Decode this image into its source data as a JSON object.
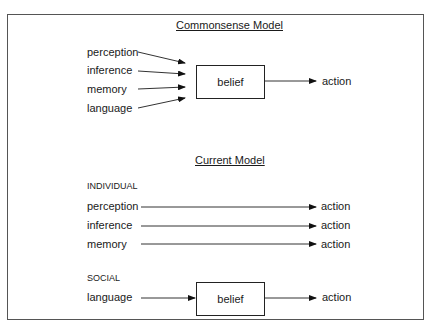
{
  "commonsense_model": {
    "title": "Commonsense Model",
    "inputs": [
      "perception",
      "inference",
      "memory",
      "language"
    ],
    "node": "belief",
    "output": "action"
  },
  "current_model": {
    "title": "Current Model",
    "individual": {
      "label": "INDIVIDUAL",
      "rows": [
        {
          "input": "perception",
          "output": "action"
        },
        {
          "input": "inference",
          "output": "action"
        },
        {
          "input": "memory",
          "output": "action"
        }
      ]
    },
    "social": {
      "label": "SOCIAL",
      "input": "language",
      "node": "belief",
      "output": "action"
    }
  }
}
